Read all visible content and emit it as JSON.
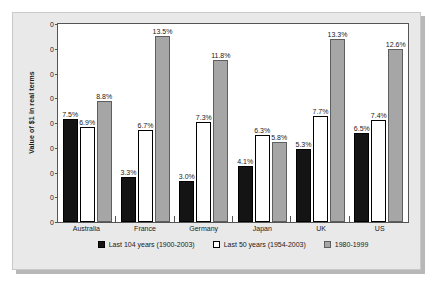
{
  "chart_data": {
    "type": "bar",
    "title": "",
    "xlabel": "",
    "ylabel": "Value of $1 in real terms",
    "categories": [
      "Australia",
      "France",
      "Germany",
      "Japan",
      "UK",
      "US"
    ],
    "grid": false,
    "legend_position": "bottom",
    "ylim": [
      0,
      8
    ],
    "yticks": [
      "0",
      "0",
      "0",
      "0",
      "0",
      "0",
      "0",
      "0",
      "0"
    ],
    "series": [
      {
        "name": "Last 104 years (1900-2003)",
        "color": "#141414",
        "values": [
          7.5,
          3.3,
          3.0,
          4.1,
          5.3,
          6.5
        ],
        "labels": [
          "7.5%",
          "3.3%",
          "3.0%",
          "4.1%",
          "5.3%",
          "6.5%"
        ]
      },
      {
        "name": "Last 50 years (1954-2003)",
        "color": "#ffffff",
        "values": [
          6.9,
          6.7,
          7.3,
          6.3,
          7.7,
          7.4
        ],
        "labels": [
          "6.9%",
          "6.7%",
          "7.3%",
          "6.3%",
          "7.7%",
          "7.4%"
        ]
      },
      {
        "name": "1980-1999",
        "color": "#a6a6a6",
        "values": [
          8.8,
          13.5,
          11.8,
          5.8,
          13.3,
          12.6
        ],
        "labels": [
          "8.8%",
          "13.5%",
          "11.8%",
          "5.8%",
          "13.3%",
          "12.6%"
        ]
      }
    ]
  }
}
